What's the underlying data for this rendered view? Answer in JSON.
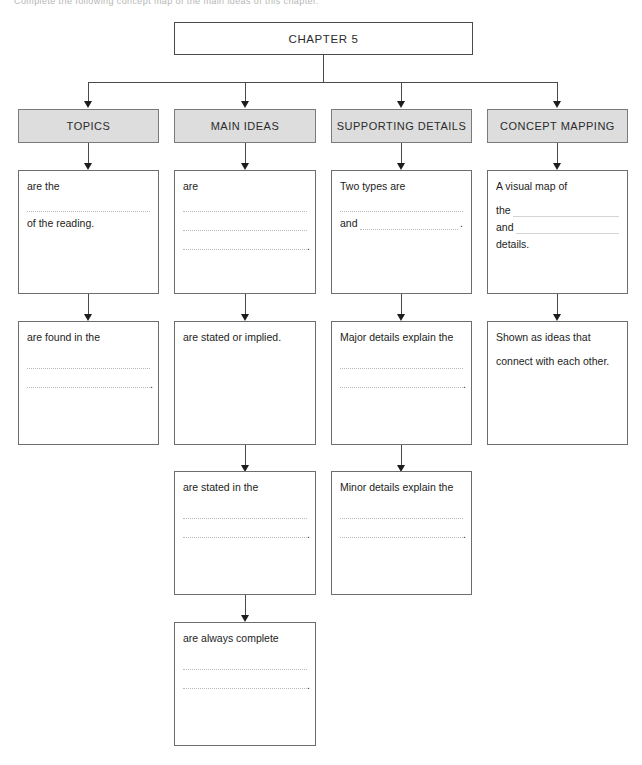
{
  "page": {
    "cropped_caption": "Complete the following concept map of the main ideas of this chapter."
  },
  "root": {
    "label": "CHAPTER 5"
  },
  "columns": [
    {
      "id": "topics",
      "header": "TOPICS",
      "boxes": [
        {
          "id": "topics-1",
          "lines": [
            {
              "type": "text",
              "value": "are the"
            },
            {
              "type": "blank"
            },
            {
              "type": "text",
              "value": "of the reading."
            }
          ]
        },
        {
          "id": "topics-2",
          "lines": [
            {
              "type": "text",
              "value": "are found in the"
            },
            {
              "type": "blank"
            },
            {
              "type": "blank-period"
            }
          ]
        }
      ]
    },
    {
      "id": "main-ideas",
      "header": "MAIN IDEAS",
      "boxes": [
        {
          "id": "main-ideas-1",
          "lines": [
            {
              "type": "text",
              "value": "are"
            },
            {
              "type": "blank"
            },
            {
              "type": "blank"
            },
            {
              "type": "blank-period"
            }
          ]
        },
        {
          "id": "main-ideas-2",
          "lines": [
            {
              "type": "text",
              "value": "are stated or implied."
            }
          ]
        },
        {
          "id": "main-ideas-3",
          "lines": [
            {
              "type": "text",
              "value": "are stated in the"
            },
            {
              "type": "blank"
            },
            {
              "type": "blank-period"
            }
          ]
        },
        {
          "id": "main-ideas-4",
          "lines": [
            {
              "type": "text",
              "value": "are always complete"
            },
            {
              "type": "blank"
            },
            {
              "type": "blank-period"
            }
          ]
        }
      ]
    },
    {
      "id": "supporting-details",
      "header": "SUPPORTING DETAILS",
      "boxes": [
        {
          "id": "supporting-details-1",
          "lines": [
            {
              "type": "text",
              "value": "Two types are"
            },
            {
              "type": "blank"
            },
            {
              "type": "inline-period",
              "lead": "and"
            }
          ]
        },
        {
          "id": "supporting-details-2",
          "lines": [
            {
              "type": "text",
              "value": "Major details explain the"
            },
            {
              "type": "blank"
            },
            {
              "type": "blank-period"
            }
          ]
        },
        {
          "id": "supporting-details-3",
          "lines": [
            {
              "type": "text",
              "value": "Minor details explain the"
            },
            {
              "type": "blank"
            },
            {
              "type": "blank-period"
            }
          ]
        }
      ]
    },
    {
      "id": "concept-mapping",
      "header": "CONCEPT MAPPING",
      "boxes": [
        {
          "id": "concept-mapping-1",
          "lines": [
            {
              "type": "text",
              "value": "A visual map of"
            },
            {
              "type": "inline-solid",
              "lead": "the"
            },
            {
              "type": "inline-solid",
              "lead": "and"
            },
            {
              "type": "text",
              "value": "details."
            }
          ]
        },
        {
          "id": "concept-mapping-2",
          "lines": [
            {
              "type": "text",
              "value": "Shown as ideas that"
            },
            {
              "type": "text-spaced",
              "value": "connect with each other."
            }
          ]
        }
      ]
    }
  ],
  "colors": {
    "header_fill": "#dddddd",
    "box_border": "#6d6d6d",
    "connector": "#4a4a4a",
    "rule": "#b9b9b9",
    "text": "#1d1d1b"
  }
}
